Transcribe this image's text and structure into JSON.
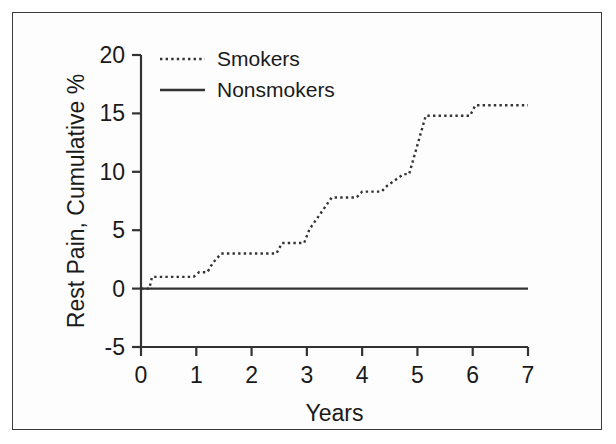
{
  "figure": {
    "background_color": "#ffffff",
    "frame_color": "#3a3a3a",
    "line_color": "#333333"
  },
  "chart_data": {
    "type": "line",
    "title": "",
    "xlabel": "Years",
    "ylabel": "Rest Pain, Cumulative %",
    "xlim": [
      0,
      7
    ],
    "ylim": [
      -5,
      20
    ],
    "xticks": [
      0,
      1,
      2,
      3,
      4,
      5,
      6,
      7
    ],
    "xtick_labels": [
      "0",
      "1",
      "2",
      "3",
      "4",
      "5",
      "6",
      "7"
    ],
    "yticks": [
      -5,
      0,
      5,
      10,
      15,
      20
    ],
    "ytick_labels": [
      "-5",
      "0",
      "5",
      "10",
      "15",
      "20"
    ],
    "grid": false,
    "legend_position": "upper left",
    "series": [
      {
        "name": "Smokers",
        "style": "dotted",
        "x": [
          0.0,
          0.15,
          0.2,
          0.95,
          1.05,
          1.2,
          1.3,
          1.45,
          2.45,
          2.55,
          2.95,
          3.05,
          3.45,
          3.9,
          4.0,
          4.35,
          4.45,
          4.75,
          4.85,
          5.15,
          5.25,
          5.95,
          6.05,
          7.0
        ],
        "y": [
          0.0,
          0.0,
          1.0,
          1.0,
          1.4,
          1.4,
          2.2,
          3.0,
          3.0,
          3.9,
          3.9,
          5.1,
          7.8,
          7.8,
          8.3,
          8.3,
          8.8,
          9.8,
          9.8,
          14.8,
          14.8,
          14.8,
          15.7,
          15.7
        ]
      },
      {
        "name": "Nonsmokers",
        "style": "solid",
        "x": [
          0.0,
          7.0
        ],
        "y": [
          0.0,
          0.0
        ]
      }
    ]
  },
  "legend": {
    "items": [
      {
        "label": "Smokers",
        "style": "dotted"
      },
      {
        "label": "Nonsmokers",
        "style": "solid"
      }
    ]
  }
}
